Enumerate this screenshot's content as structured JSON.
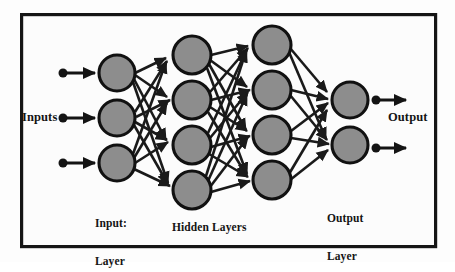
{
  "diagram": {
    "type": "neural-network-diagram",
    "background_color": "#fdfdfd",
    "frame": {
      "stroke_color": "#151515",
      "stroke_width": 3.2,
      "x": 20,
      "y": 13,
      "width": 417,
      "height": 235
    },
    "node_style": {
      "fill_color": "#8d8d8d",
      "stroke_color": "#111111",
      "stroke_width": 3.1
    },
    "connection_style": {
      "stroke_color": "#1a1a1a",
      "stroke_width": 2.6,
      "arrowhead": true
    },
    "labels": {
      "inputs": "Inputs",
      "output": "Output",
      "input_layer_line1": "Input:",
      "input_layer_line2": "Layer",
      "hidden_layers": "Hidden Layers",
      "output_layer_line1": "Output",
      "output_layer_line2": "Layer"
    },
    "layers": [
      {
        "name": "input-layer",
        "label": "Input: Layer",
        "node_count": 3,
        "x": 117,
        "radius": 18,
        "node_y": [
          73,
          118,
          163
        ]
      },
      {
        "name": "hidden-layer-1",
        "label": "Hidden Layers",
        "node_count": 4,
        "x": 192,
        "radius": 19,
        "node_y": [
          55,
          100,
          145,
          190
        ]
      },
      {
        "name": "hidden-layer-2",
        "label": "Hidden Layers",
        "node_count": 4,
        "x": 272,
        "radius": 19,
        "node_y": [
          45,
          90,
          135,
          180
        ]
      },
      {
        "name": "output-layer",
        "label": "Output Layer",
        "node_count": 2,
        "x": 350,
        "radius": 18,
        "node_y": [
          100,
          145
        ]
      }
    ],
    "input_arrows": [
      {
        "y": 73,
        "x_start": 62,
        "x_end": 96
      },
      {
        "y": 118,
        "x_start": 62,
        "x_end": 96
      },
      {
        "y": 163,
        "x_start": 62,
        "x_end": 96
      }
    ],
    "output_arrows": [
      {
        "y": 100,
        "x_start": 375,
        "x_end": 406
      },
      {
        "y": 148,
        "x_start": 375,
        "x_end": 406
      }
    ],
    "connection_counts": {
      "input_to_hidden1": 12,
      "hidden1_to_hidden2": 16,
      "hidden2_to_output": 8
    }
  }
}
